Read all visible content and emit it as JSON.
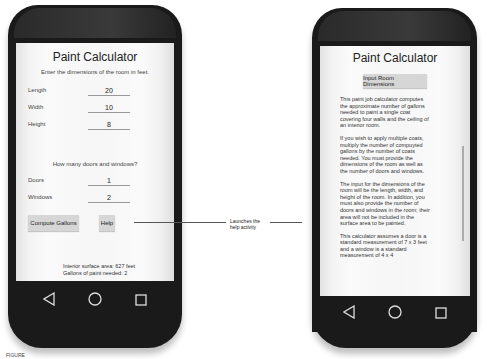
{
  "left_screen": {
    "title": "Paint Calculator",
    "instruction": "Enter the dimensions of the room in feet.",
    "fields": [
      {
        "label": "Length",
        "value": "20"
      },
      {
        "label": "Width",
        "value": "10"
      },
      {
        "label": "Height",
        "value": "8"
      }
    ],
    "question": "How many doors and windows?",
    "count_fields": [
      {
        "label": "Doors",
        "value": "1"
      },
      {
        "label": "Windows",
        "value": "2"
      }
    ],
    "buttons": {
      "compute": "Compute Gallons",
      "help": "Help"
    },
    "results": {
      "area": "Interior surface area: 627 feet",
      "gallons": "Gallons of paint needed: 2"
    }
  },
  "callout": {
    "text_line1": "Launches the",
    "text_line2": "help activity"
  },
  "right_screen": {
    "title": "Paint Calculator",
    "button": "Input Room Dimensions",
    "paragraphs": [
      "This paint job calculator computes the approximate number of gallons needed to paint a single coat covering four walls and the ceiling of an interior room.",
      "If you wish to apply multiple coats, multiply the number of compuyted gallons by the number of coats needed. You must provide the dimensions of the room as well as the number of doors and windows.",
      "The input for the dimensions of the room will be the length, width, and height of the room. In addition, you must also provide the number of doors and windows in the room; their area will not be included in the surface area to be painted.",
      "This calculator assumes a door is a standard measurement of 7 x 3 feet and a window is a standard measurement of 4 x 4"
    ]
  },
  "navbar": {
    "back": "back-icon",
    "home": "home-icon",
    "recent": "recent-apps-icon"
  },
  "caption": "FIGURE"
}
